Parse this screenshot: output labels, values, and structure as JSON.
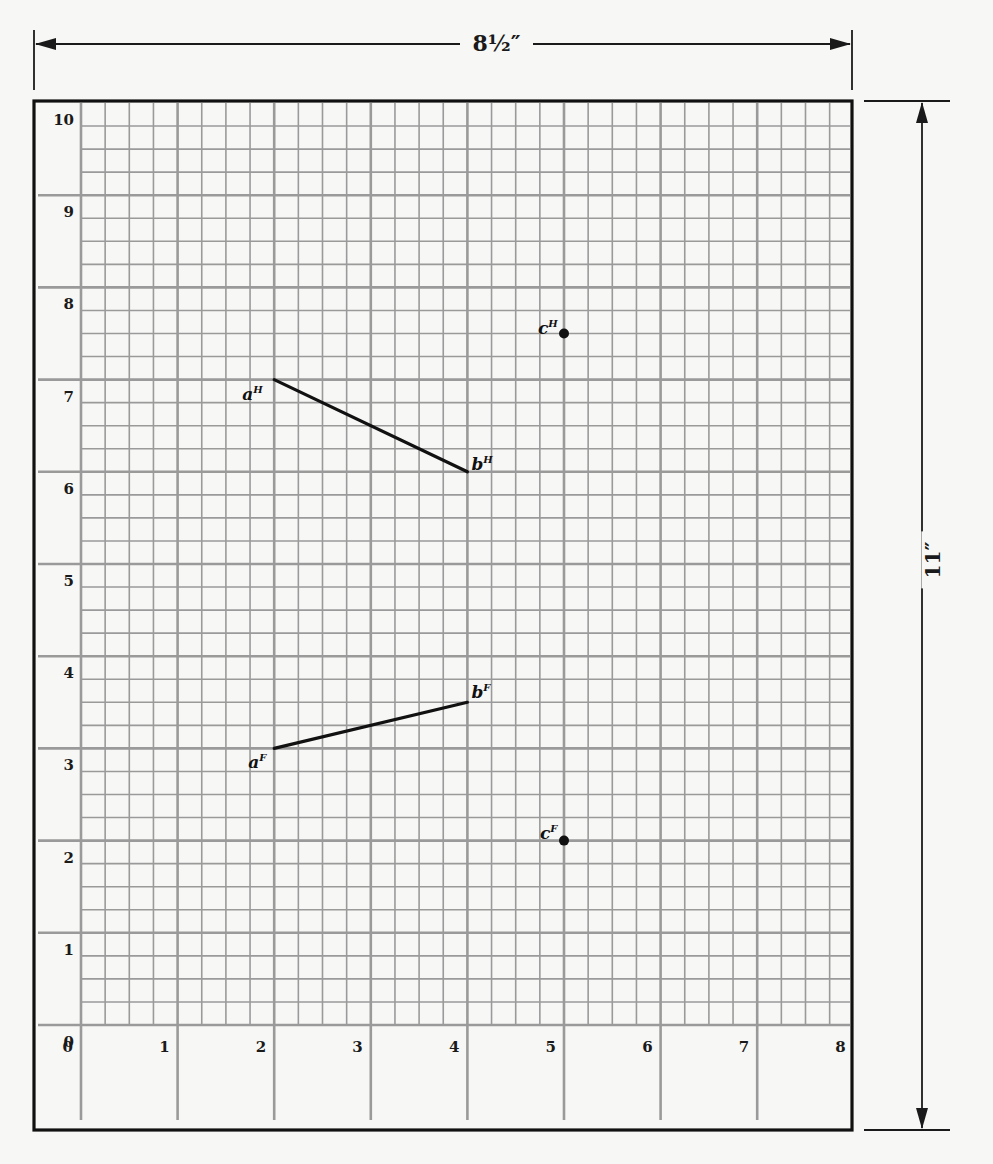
{
  "dimensions": {
    "width_label": "8½″",
    "height_label": "11″"
  },
  "grid": {
    "x_range": [
      0,
      8
    ],
    "y_range": [
      0,
      10
    ],
    "subdivisions_per_unit": 4,
    "x_tick_labels": [
      "0",
      "1",
      "2",
      "3",
      "4",
      "5",
      "6",
      "7",
      "8"
    ],
    "y_tick_labels": [
      "0",
      "1",
      "2",
      "3",
      "4",
      "5",
      "6",
      "7",
      "8",
      "9",
      "10"
    ],
    "line_color": "#9a9a9a",
    "border_color": "#111111"
  },
  "chart_data": {
    "type": "scatter",
    "title": "",
    "xlabel": "",
    "ylabel": "",
    "xlim": [
      0,
      8
    ],
    "ylim": [
      0,
      10
    ],
    "grid": true,
    "points": [
      {
        "label": "aH",
        "display": "a",
        "superscript": "H",
        "x": 2,
        "y": 7
      },
      {
        "label": "bH",
        "display": "b",
        "superscript": "H",
        "x": 4,
        "y": 6
      },
      {
        "label": "cH",
        "display": "c",
        "superscript": "H",
        "x": 5,
        "y": 7.5,
        "marker": "dot"
      },
      {
        "label": "aF",
        "display": "a",
        "superscript": "F",
        "x": 2,
        "y": 3
      },
      {
        "label": "bF",
        "display": "b",
        "superscript": "F",
        "x": 4,
        "y": 3.5
      },
      {
        "label": "cF",
        "display": "c",
        "superscript": "F",
        "x": 5,
        "y": 2,
        "marker": "dot"
      }
    ],
    "segments": [
      {
        "name": "aHbH",
        "from": [
          2,
          7
        ],
        "to": [
          4,
          6
        ],
        "view": "H"
      },
      {
        "name": "aFbF",
        "from": [
          2,
          3
        ],
        "to": [
          4,
          3.5
        ],
        "view": "F"
      }
    ],
    "annotations": [
      "8½″ (sheet width)",
      "11″ (sheet height)"
    ]
  }
}
